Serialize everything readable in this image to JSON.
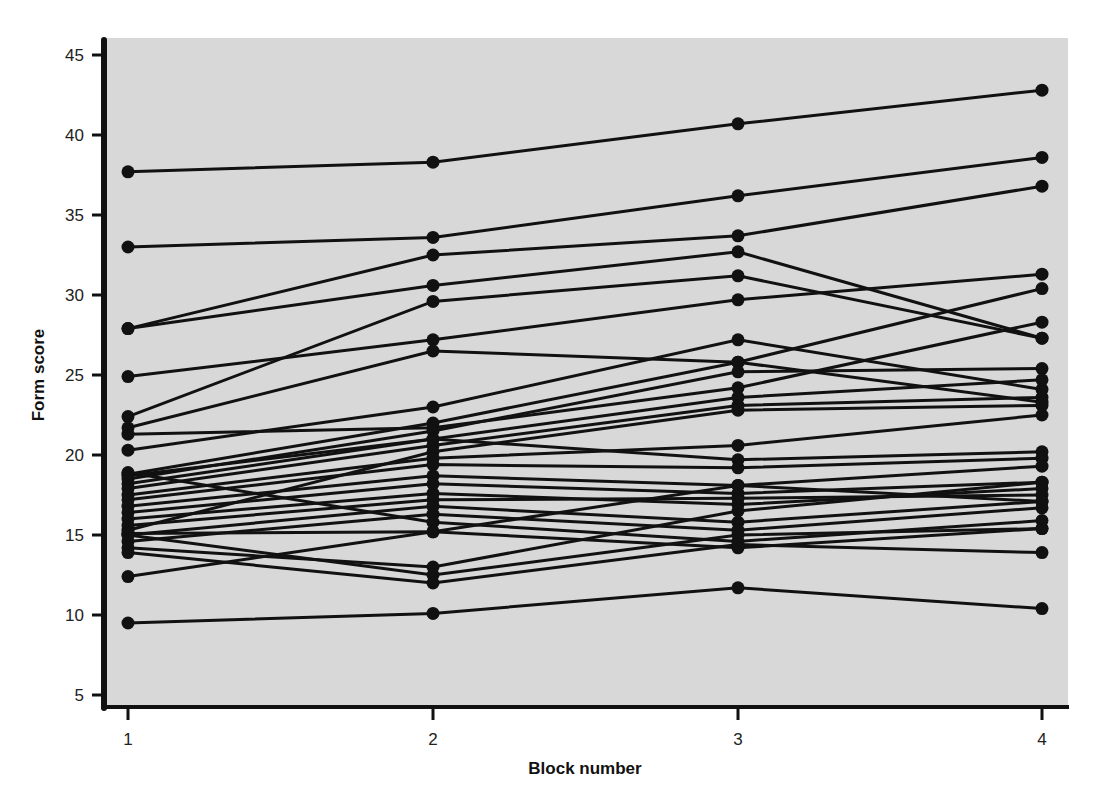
{
  "chart_data": {
    "type": "line",
    "title": "",
    "xlabel": "Block number",
    "ylabel": "Form score",
    "x": [
      1,
      2,
      3,
      4
    ],
    "x_tick_labels": [
      "1",
      "2",
      "3",
      "4"
    ],
    "y_ticks": [
      5,
      10,
      15,
      20,
      25,
      30,
      35,
      40,
      45
    ],
    "y_tick_labels": [
      "5",
      "10",
      "15",
      "20",
      "25",
      "30",
      "35",
      "40",
      "45"
    ],
    "ylim": [
      4,
      46
    ],
    "xlim": [
      0.92,
      4.08
    ],
    "grid": false,
    "legend": "none",
    "background_color": "#d8d8d8",
    "line_color": "#111111",
    "marker": "filled-circle",
    "series": [
      {
        "name": "subject-1",
        "values": [
          37.7,
          38.3,
          40.7,
          42.8
        ]
      },
      {
        "name": "subject-2",
        "values": [
          33.0,
          33.6,
          36.2,
          38.6
        ]
      },
      {
        "name": "subject-3",
        "values": [
          27.9,
          32.5,
          33.7,
          36.8
        ]
      },
      {
        "name": "subject-4",
        "values": [
          27.9,
          30.6,
          32.7,
          27.3
        ]
      },
      {
        "name": "subject-5",
        "values": [
          22.4,
          29.6,
          31.2,
          27.3
        ]
      },
      {
        "name": "subject-6",
        "values": [
          24.9,
          27.2,
          29.7,
          31.3
        ]
      },
      {
        "name": "subject-7",
        "values": [
          21.7,
          26.5,
          25.8,
          23.3
        ]
      },
      {
        "name": "subject-8",
        "values": [
          20.3,
          23.0,
          27.2,
          24.1
        ]
      },
      {
        "name": "subject-9",
        "values": [
          18.8,
          22.0,
          25.8,
          30.4
        ]
      },
      {
        "name": "subject-10",
        "values": [
          21.3,
          21.7,
          24.2,
          28.3
        ]
      },
      {
        "name": "subject-11",
        "values": [
          18.5,
          21.5,
          25.2,
          25.4
        ]
      },
      {
        "name": "subject-12",
        "values": [
          18.2,
          21.0,
          23.6,
          24.7
        ]
      },
      {
        "name": "subject-13",
        "values": [
          17.9,
          20.6,
          23.1,
          23.6
        ]
      },
      {
        "name": "subject-14",
        "values": [
          15.3,
          20.2,
          22.8,
          23.1
        ]
      },
      {
        "name": "subject-15",
        "values": [
          17.5,
          19.8,
          20.6,
          22.5
        ]
      },
      {
        "name": "subject-16",
        "values": [
          18.7,
          21.0,
          19.7,
          20.2
        ]
      },
      {
        "name": "subject-17",
        "values": [
          17.2,
          19.4,
          19.2,
          19.8
        ]
      },
      {
        "name": "subject-18",
        "values": [
          16.8,
          18.7,
          18.1,
          19.3
        ]
      },
      {
        "name": "subject-19",
        "values": [
          16.4,
          18.2,
          17.6,
          18.3
        ]
      },
      {
        "name": "subject-20",
        "values": [
          16.0,
          17.6,
          16.9,
          17.9
        ]
      },
      {
        "name": "subject-21",
        "values": [
          15.6,
          17.2,
          17.3,
          17.5
        ]
      },
      {
        "name": "subject-22",
        "values": [
          15.0,
          16.8,
          15.8,
          17.1
        ]
      },
      {
        "name": "subject-23",
        "values": [
          14.6,
          16.3,
          15.3,
          16.7
        ]
      },
      {
        "name": "subject-24",
        "values": [
          18.9,
          15.8,
          14.6,
          15.9
        ]
      },
      {
        "name": "subject-25",
        "values": [
          15.1,
          15.2,
          14.2,
          15.4
        ]
      },
      {
        "name": "subject-26",
        "values": [
          14.2,
          13.0,
          16.5,
          18.3
        ]
      },
      {
        "name": "subject-27",
        "values": [
          15.0,
          12.5,
          15.0,
          15.4
        ]
      },
      {
        "name": "subject-28",
        "values": [
          13.9,
          12.0,
          14.4,
          13.9
        ]
      },
      {
        "name": "subject-29",
        "values": [
          12.4,
          15.2,
          18.1,
          17.1
        ]
      },
      {
        "name": "subject-30",
        "values": [
          9.5,
          10.1,
          11.7,
          10.4
        ]
      }
    ]
  },
  "axes": {
    "x_title": "Block number",
    "y_title": "Form score"
  }
}
